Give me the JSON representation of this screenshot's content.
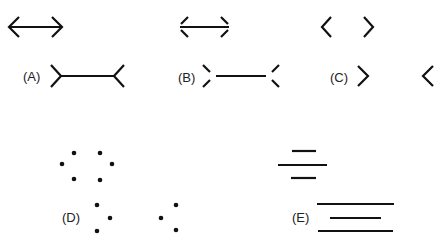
{
  "colors": {
    "ink": "#111111",
    "background": "#ffffff"
  },
  "labels": {
    "a": "(A)",
    "b": "(B)",
    "c": "(C)",
    "d": "(D)",
    "e": "(E)"
  },
  "figures": [
    {
      "id": "A",
      "description": "Line with arrowheads vs. line with outward fins"
    },
    {
      "id": "B",
      "description": "Gapped arrowheads vs. gapped fins"
    },
    {
      "id": "C",
      "description": "Chevrons only, no shaft"
    },
    {
      "id": "D",
      "description": "Dot configurations implying chevrons"
    },
    {
      "id": "E",
      "description": "Parallel lines of differing lengths"
    }
  ]
}
